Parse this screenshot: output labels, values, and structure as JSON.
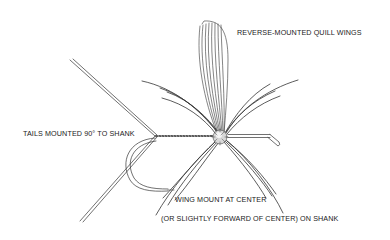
{
  "diagram": {
    "type": "technical illustration",
    "colors": {
      "line": "#333333",
      "background": "#ffffff",
      "text": "#1a1a1a"
    },
    "labels": {
      "wings": "REVERSE-MOUNTED QUILL WINGS",
      "tails": "TAILS MOUNTED 90° TO SHANK",
      "wing_mount_line1": "WING MOUNT AT CENTER",
      "wing_mount_line2": "(OR SLIGHTLY FORWARD OF CENTER) ON SHANK"
    },
    "components": [
      "quill-wings",
      "hackle-fibers",
      "tails",
      "hook-shank",
      "hook-bend",
      "hook-eye",
      "thread-wraps",
      "wing-knot"
    ]
  }
}
